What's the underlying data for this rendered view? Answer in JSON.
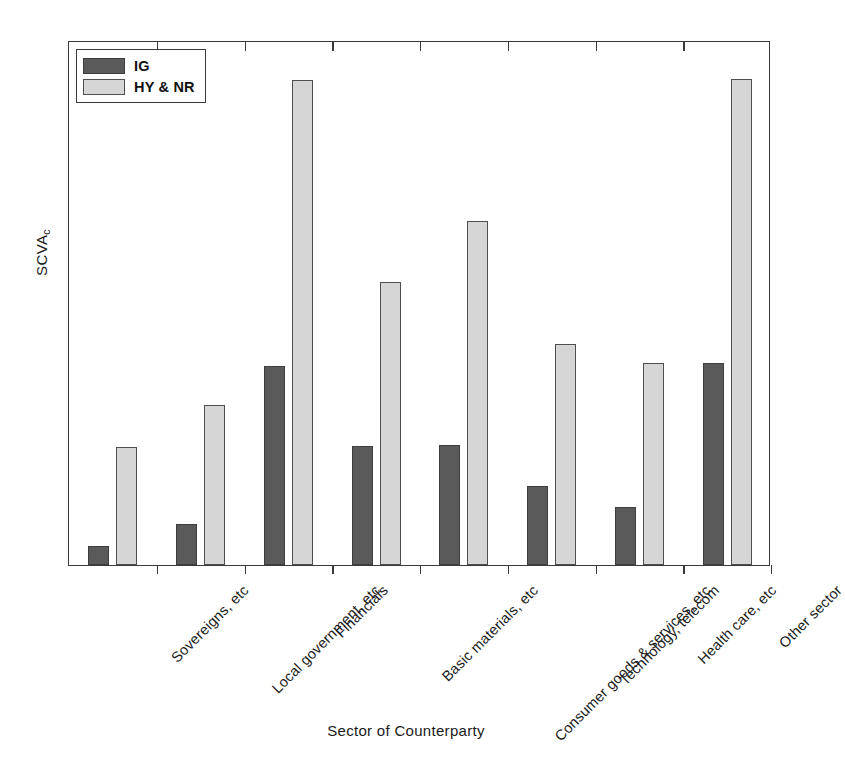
{
  "chart_data": {
    "type": "bar",
    "title": "",
    "subtitle": "",
    "xlabel": "Sector of Counterparty",
    "ylabel": "SCVA",
    "ylabel_subscript": "c",
    "grid": false,
    "legend_position": "top-left",
    "axis_tick_labels_y": [],
    "ylim": [
      0,
      1
    ],
    "categories": [
      "Sovereigns, etc",
      "Local government, etc",
      "Financials",
      "Basic materials, etc",
      "Consumer goods & services, etc",
      "Technology, telecom",
      "Health care, etc",
      "Other sector"
    ],
    "series": [
      {
        "name": "IG",
        "color": "#5a5a5a",
        "values": [
          0.036,
          0.078,
          0.379,
          0.227,
          0.229,
          0.15,
          0.11,
          0.385
        ]
      },
      {
        "name": "HY & NR",
        "color": "#d6d6d6",
        "values": [
          0.225,
          0.305,
          0.924,
          0.539,
          0.655,
          0.421,
          0.385,
          0.926
        ]
      }
    ]
  },
  "legend": {
    "entries": [
      {
        "label": "IG",
        "swatch": "dark-gray-swatch"
      },
      {
        "label": "HY & NR",
        "swatch": "light-gray-swatch"
      }
    ]
  },
  "axes": {
    "y_title": "SCVA",
    "y_title_subscript": "c",
    "x_title": "Sector of Counterparty"
  },
  "colors": {
    "ig_fill": "#5a5a5a",
    "hy_fill": "#d6d6d6",
    "frame": "#3a3a3a",
    "background": "#ffffff",
    "text": "#1a1a1a"
  }
}
